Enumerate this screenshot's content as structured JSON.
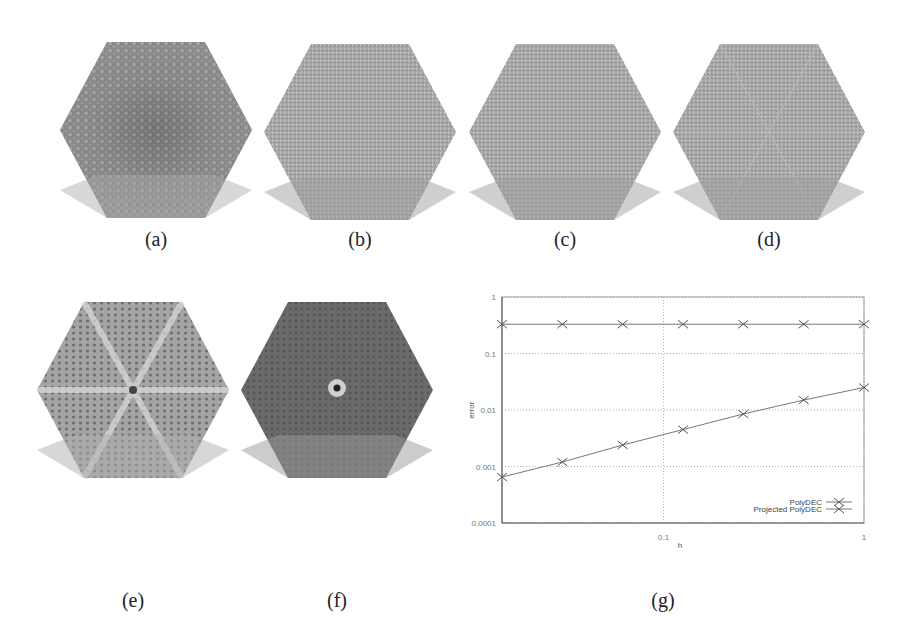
{
  "figure": {
    "panels": [
      {
        "id": "a",
        "label": "(a)",
        "style": "dark-cellular-gradient"
      },
      {
        "id": "b",
        "label": "(b)",
        "style": "light-gray-noise"
      },
      {
        "id": "c",
        "label": "(c)",
        "style": "light-gray-noise"
      },
      {
        "id": "d",
        "label": "(d)",
        "style": "light-gray-noise-radial"
      },
      {
        "id": "e",
        "label": "(e)",
        "style": "star-pattern-light"
      },
      {
        "id": "f",
        "label": "(f)",
        "style": "dark-with-center-singularity"
      },
      {
        "id": "g",
        "label": "(g)",
        "style": "loglog-plot"
      }
    ]
  },
  "chart_data": {
    "type": "line",
    "title": "",
    "xlabel": "h",
    "ylabel": "error",
    "xscale": "log",
    "yscale": "log",
    "xlim": [
      0.015625,
      1
    ],
    "ylim": [
      0.0001,
      1
    ],
    "x_ticks": [
      "0.1",
      "1"
    ],
    "y_ticks": [
      "0.0001",
      "0.001",
      "0.01",
      "0.1",
      "1"
    ],
    "grid": true,
    "legend_position": "lower right",
    "x": [
      0.015625,
      0.03125,
      0.0625,
      0.125,
      0.25,
      0.5,
      1
    ],
    "series": [
      {
        "name": "PolyDEC",
        "marker": "x",
        "values": [
          0.33,
          0.33,
          0.33,
          0.33,
          0.33,
          0.33,
          0.33
        ]
      },
      {
        "name": "Projected PolyDEC",
        "marker": "x",
        "values": [
          0.00065,
          0.0012,
          0.0024,
          0.0045,
          0.0085,
          0.015,
          0.025
        ]
      }
    ]
  }
}
